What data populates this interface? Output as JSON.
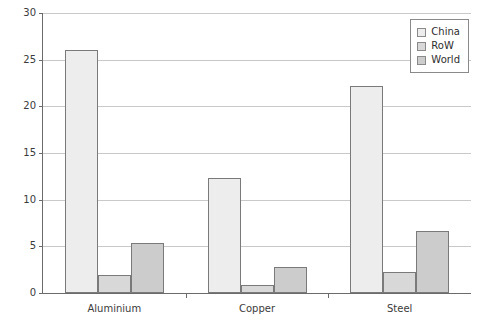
{
  "chart_data": {
    "type": "bar",
    "title": "",
    "subtitle": "",
    "xlabel": "",
    "ylabel": "",
    "categories": [
      "Aluminium",
      "Copper",
      "Steel"
    ],
    "series": [
      {
        "name": "China",
        "values": [
          26.0,
          12.3,
          22.2
        ],
        "color": "#ededed"
      },
      {
        "name": "RoW",
        "values": [
          1.9,
          0.9,
          2.3
        ],
        "color": "#d8d8d8"
      },
      {
        "name": "World",
        "values": [
          5.4,
          2.8,
          6.6
        ],
        "color": "#cccccc"
      }
    ],
    "ylim": [
      0,
      30
    ],
    "yticks": [
      0,
      5,
      10,
      15,
      20,
      25,
      30
    ],
    "ytick_labels": [
      "0",
      "5",
      "10",
      "15",
      "20",
      "25",
      "30"
    ],
    "grid": true,
    "grid_axis": "y",
    "legend_position": "top-right",
    "legend_entries": [
      "China",
      "RoW",
      "World"
    ],
    "annotations": []
  },
  "legend": {
    "items": [
      {
        "label": "China"
      },
      {
        "label": "RoW"
      },
      {
        "label": "World"
      }
    ]
  },
  "axes": {
    "y": {
      "ticks": [
        "0",
        "5",
        "10",
        "15",
        "20",
        "25",
        "30"
      ]
    },
    "x": {
      "ticks": [
        "Aluminium",
        "Copper",
        "Steel"
      ]
    }
  }
}
